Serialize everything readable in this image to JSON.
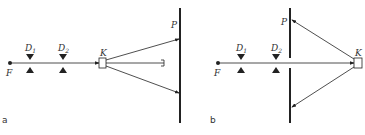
{
  "figure": {
    "panels": [
      {
        "id": "a",
        "panel_label": "a",
        "labels": {
          "source": "F",
          "diaphragm1": "D",
          "diaphragm1_sub": "1",
          "diaphragm2": "D",
          "diaphragm2_sub": "2",
          "crystal": "K",
          "screen": "P"
        }
      },
      {
        "id": "b",
        "panel_label": "b",
        "labels": {
          "source": "F",
          "diaphragm1": "D",
          "diaphragm1_sub": "1",
          "diaphragm2": "D",
          "diaphragm2_sub": "2",
          "crystal": "K",
          "screen": "P"
        }
      }
    ],
    "colors": {
      "line": "#222222",
      "background": "#ffffff"
    }
  }
}
